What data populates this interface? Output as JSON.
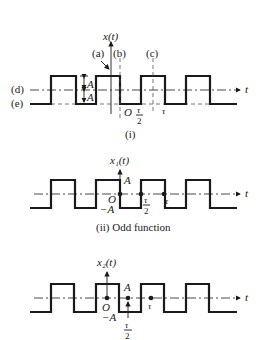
{
  "figure": {
    "panel_i": {
      "y_label": "x(t)",
      "x_label": "t",
      "caption": "(i)",
      "axis_labels": {
        "a": "(a)",
        "b": "(b)",
        "c": "(c)",
        "d": "(d)",
        "e": "(e)"
      },
      "amplitude_label_upper": "A",
      "amplitude_label_lower": "A",
      "origin_label": "O",
      "tick_half_period_num": "τ",
      "tick_half_period_den": "2",
      "tick_period": "τ"
    },
    "panel_ii": {
      "y_label": "x₁(t)",
      "x_label": "t",
      "caption": "(ii) Odd function",
      "amp_pos": "A",
      "amp_neg": "−A",
      "origin_label": "O",
      "tick_half_period_num": "τ",
      "tick_half_period_den": "2",
      "tick_period": "τ"
    },
    "panel_iii": {
      "y_label": "x₂(t)",
      "x_label": "t",
      "amp_pos": "A",
      "amp_neg": "−A",
      "origin_label": "O",
      "tick_half_period_num": "τ",
      "tick_half_period_den": "2",
      "tick_period": "τ"
    }
  }
}
